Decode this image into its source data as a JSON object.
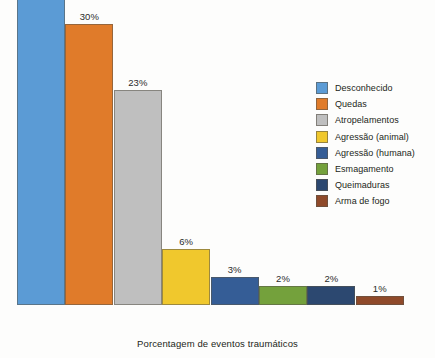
{
  "caption": "Porcentagem de eventos traumáticos",
  "chart_data": {
    "type": "bar",
    "title": "",
    "subtitle": "",
    "xlabel": "Porcentagem de eventos traumáticos",
    "ylabel": "",
    "ylim": [
      0,
      35
    ],
    "grid": false,
    "legend_position": "right",
    "value_suffix": "%",
    "categories": [
      "Desconhecido",
      "Quedas",
      "Atropelamentos",
      "Agressão (animal)",
      "Agressão (humana)",
      "Esmagamento",
      "Queimaduras",
      "Arma de fogo"
    ],
    "values": [
      33,
      30,
      23,
      6,
      3,
      2,
      2,
      1
    ],
    "value_labels": [
      "33%",
      "30%",
      "23%",
      "6%",
      "3%",
      "2%",
      "2%",
      "1%"
    ],
    "colors": [
      "#5b9bd5",
      "#e07b2a",
      "#bfbfbf",
      "#f0c82d",
      "#355d96",
      "#74a13c",
      "#2c4870",
      "#8f4a2a"
    ]
  },
  "legend": {
    "items": [
      {
        "label": "Desconhecido",
        "color": "#5b9bd5"
      },
      {
        "label": "Quedas",
        "color": "#e07b2a"
      },
      {
        "label": "Atropelamentos",
        "color": "#bfbfbf"
      },
      {
        "label": "Agressão (animal)",
        "color": "#f0c82d"
      },
      {
        "label": "Agressão (humana)",
        "color": "#355d96"
      },
      {
        "label": "Esmagamento",
        "color": "#74a13c"
      },
      {
        "label": "Queimaduras",
        "color": "#2c4870"
      },
      {
        "label": "Arma de fogo",
        "color": "#8f4a2a"
      }
    ]
  },
  "layout": {
    "bar_left_start": 17,
    "bar_width": 48,
    "bar_pitch": 48.4,
    "px_per_percent": 9.36
  }
}
